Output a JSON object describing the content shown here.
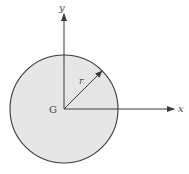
{
  "figure": {
    "type": "rigid body cross-section with centroidal axes",
    "cropped_top_text": "",
    "disk": {
      "shape": "circle",
      "fill_color": "#e6e6e6",
      "stroke_color": "#3a3a3a",
      "center": {
        "x": 64,
        "y": 109
      },
      "radius_px": 54
    },
    "center_label": "G",
    "radius_label": "r",
    "axes": {
      "x_label": "x",
      "y_label": "y",
      "color": "#3a3a3a"
    }
  }
}
